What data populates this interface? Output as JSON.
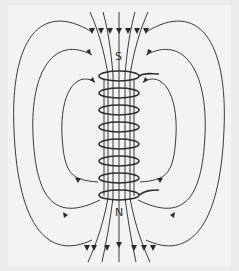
{
  "diagram": {
    "labels": {
      "top_pole": "S",
      "bottom_pole": "N"
    },
    "colors": {
      "background": "#efefef",
      "line": "#3a3a3a",
      "coil": "#2e2e2e"
    },
    "coil": {
      "turns": 8,
      "center_x": 119,
      "top_y": 72,
      "bottom_y": 198,
      "radius_x": 20,
      "radius_y": 5
    }
  }
}
